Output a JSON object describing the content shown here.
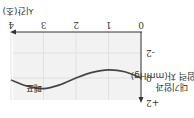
{
  "orientation": "rotated-180",
  "chart_data": {
    "type": "line",
    "title": "",
    "xlabel": "시간(초)",
    "ylabel_lines": [
      "대기압과",
      "폐포 압력 차(mmHg)"
    ],
    "x_ticks": [
      "0",
      "1",
      "2",
      "3",
      "4"
    ],
    "y_ticks": [
      "-2",
      "0",
      "+2"
    ],
    "xlim": [
      0,
      4
    ],
    "ylim": [
      -3,
      2
    ],
    "grid": true,
    "series": [
      {
        "name": "폐포",
        "x": [
          0,
          0.5,
          1,
          1.5,
          2,
          2.5,
          3,
          3.5,
          4
        ],
        "values": [
          0,
          -0.5,
          -0.65,
          -0.45,
          0,
          0.55,
          0.85,
          0.65,
          0.15
        ]
      }
    ],
    "annotations": [
      "폐포"
    ]
  },
  "colors": {
    "plot_bg": "#f2f2f2",
    "grid": "#dcdcdc",
    "axis": "#333333",
    "curve": "#444444"
  }
}
